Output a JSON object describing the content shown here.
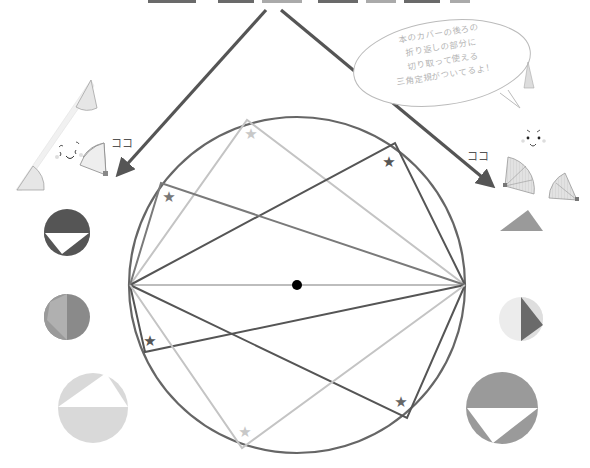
{
  "header": {
    "cropped_title_visible": false
  },
  "speech_bubble": {
    "lines": [
      "本のカバーの後ろの",
      "折り返しの部分に",
      "切り取って使える",
      "三角定規がついてるよ！"
    ]
  },
  "labels": {
    "left_here": "ココ",
    "right_here": "ココ"
  },
  "colors": {
    "circle_stroke": "#666666",
    "dark_line": "#555555",
    "mid_line": "#7a7a7a",
    "light_line": "#bdbdbd",
    "center_dot": "#000000",
    "arrow": "#555555"
  },
  "diagram": {
    "circle": {
      "cx": 297,
      "cy": 285,
      "r": 168
    },
    "diameter": {
      "x1": 130,
      "y1": 285,
      "x2": 465,
      "y2": 285
    },
    "inscribed_angles": [
      {
        "apex": [
          247,
          120
        ],
        "tone": "light",
        "star": [
          251,
          134
        ]
      },
      {
        "apex": [
          395,
          143
        ],
        "tone": "dark",
        "star": [
          389,
          162
        ]
      },
      {
        "apex": [
          161,
          183
        ],
        "tone": "mid",
        "star": [
          169,
          197
        ]
      },
      {
        "apex": [
          145,
          352
        ],
        "tone": "dark",
        "star": [
          150,
          341
        ]
      },
      {
        "apex": [
          407,
          418
        ],
        "tone": "dark",
        "star": [
          401,
          402
        ]
      },
      {
        "apex": [
          242,
          448
        ],
        "tone": "light",
        "star": [
          245,
          432
        ]
      }
    ]
  },
  "thumbnails": {
    "left": [
      {
        "name": "dark-half-circle",
        "cx": 67,
        "cy": 232,
        "r": 23
      },
      {
        "name": "mid-split-circle",
        "cx": 67,
        "cy": 317,
        "r": 23
      },
      {
        "name": "light-half-circle",
        "cx": 93,
        "cy": 408,
        "r": 35
      }
    ],
    "right": [
      {
        "name": "gray-triangle",
        "points": "500,231 528,210 543,231"
      },
      {
        "name": "light-split-circle",
        "cx": 521,
        "cy": 319,
        "r": 22
      },
      {
        "name": "mid-half-circle",
        "cx": 502,
        "cy": 408,
        "r": 36
      }
    ]
  }
}
